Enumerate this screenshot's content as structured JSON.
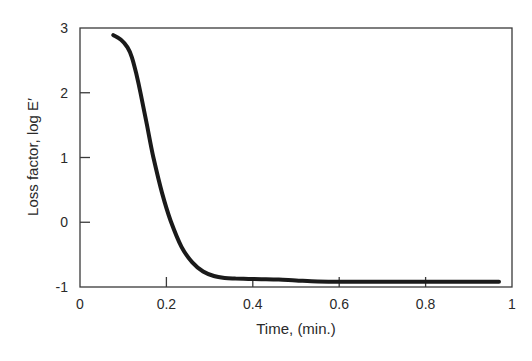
{
  "chart_data": {
    "type": "line",
    "title": "",
    "xlabel": "Time, (min.)",
    "ylabel": "Loss factor, log E′",
    "xlim": [
      0,
      1
    ],
    "ylim": [
      -1,
      3
    ],
    "x_ticks": [
      0,
      0.2,
      0.4,
      0.6,
      0.8,
      1
    ],
    "x_tick_labels": [
      "0",
      "0.2",
      "0.4",
      "0.6",
      "0.8",
      "1"
    ],
    "y_ticks": [
      -1,
      0,
      1,
      2,
      3
    ],
    "y_tick_labels": [
      "-1",
      "0",
      "1",
      "2",
      "3"
    ],
    "grid": false,
    "legend": "none",
    "series": [
      {
        "name": "Loss factor",
        "color": "#1a1a1a",
        "x": [
          0.077,
          0.095,
          0.11,
          0.12,
          0.13,
          0.14,
          0.155,
          0.17,
          0.19,
          0.21,
          0.235,
          0.26,
          0.285,
          0.31,
          0.335,
          0.36,
          0.39,
          0.42,
          0.46,
          0.5,
          0.55,
          0.6,
          0.7,
          0.8,
          0.9,
          0.97
        ],
        "y": [
          2.89,
          2.82,
          2.7,
          2.55,
          2.3,
          2.0,
          1.5,
          1.0,
          0.45,
          0.02,
          -0.38,
          -0.62,
          -0.76,
          -0.83,
          -0.86,
          -0.87,
          -0.875,
          -0.88,
          -0.885,
          -0.9,
          -0.915,
          -0.92,
          -0.92,
          -0.92,
          -0.92,
          -0.92
        ]
      }
    ]
  }
}
